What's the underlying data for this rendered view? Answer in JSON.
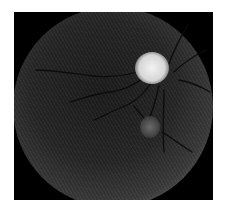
{
  "image": {
    "subject": "retinal fundus photograph (grayscale)",
    "features": [
      "optic disc",
      "blood vessels",
      "lesion spot"
    ],
    "colors": {
      "background": "#ffffff",
      "frame": "#000000",
      "disc": "#e6e6e6"
    }
  }
}
